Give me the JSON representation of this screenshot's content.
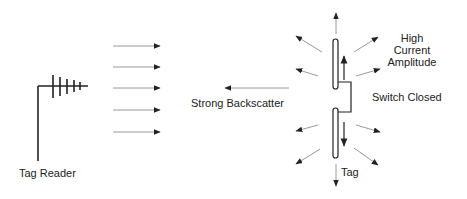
{
  "diagram": {
    "reader": {
      "label": "Tag Reader"
    },
    "incoming_waves": {
      "count": 5
    },
    "backscatter": {
      "label": "Strong Backscatter"
    },
    "tag": {
      "label": "Tag",
      "current_label_lines": [
        "High",
        "Current",
        "Amplitude"
      ],
      "switch_label": "Switch Closed"
    },
    "colors": {
      "line": "#222222",
      "wave": "#9a9a9a",
      "text": "#222222"
    }
  }
}
